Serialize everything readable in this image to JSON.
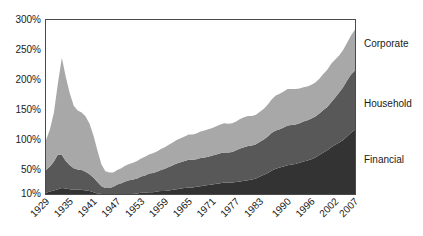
{
  "chart_data": {
    "type": "area",
    "stacked": true,
    "title": "",
    "subtitle": "",
    "xlabel": "",
    "ylabel": "",
    "grid": false,
    "legend_position": "right-inline",
    "x_tick_labels": [
      "1929",
      "1935",
      "1941",
      "1947",
      "1953",
      "1959",
      "1965",
      "1971",
      "1977",
      "1983",
      "1990",
      "1996",
      "2002",
      "2007"
    ],
    "y_tick_labels": [
      "300%",
      "250%",
      "200%",
      "150%",
      "100%",
      "50%",
      "10%"
    ],
    "y_tick_values": [
      300,
      250,
      200,
      150,
      100,
      50,
      10
    ],
    "ylim": [
      10,
      300
    ],
    "xlim": [
      1929,
      2007
    ],
    "x": [
      1929,
      1930,
      1931,
      1932,
      1933,
      1934,
      1935,
      1936,
      1937,
      1938,
      1939,
      1940,
      1941,
      1942,
      1943,
      1944,
      1945,
      1946,
      1947,
      1948,
      1949,
      1950,
      1951,
      1952,
      1953,
      1954,
      1955,
      1956,
      1957,
      1958,
      1959,
      1960,
      1961,
      1962,
      1963,
      1964,
      1965,
      1966,
      1967,
      1968,
      1969,
      1970,
      1971,
      1972,
      1973,
      1974,
      1975,
      1976,
      1977,
      1978,
      1979,
      1980,
      1981,
      1982,
      1983,
      1984,
      1985,
      1986,
      1987,
      1988,
      1989,
      1990,
      1991,
      1992,
      1993,
      1994,
      1995,
      1996,
      1997,
      1998,
      1999,
      2000,
      2001,
      2002,
      2003,
      2004,
      2005,
      2006,
      2007
    ],
    "series": [
      {
        "name": "Financial",
        "color": "#333333",
        "values": [
          12,
          14,
          16,
          18,
          20,
          19,
          18,
          17,
          17,
          17,
          16,
          15,
          13,
          11,
          9,
          8,
          8,
          8,
          9,
          9,
          10,
          10,
          10,
          11,
          12,
          12,
          13,
          13,
          14,
          15,
          15,
          16,
          17,
          18,
          19,
          20,
          21,
          21,
          22,
          23,
          24,
          25,
          26,
          27,
          28,
          29,
          29,
          29,
          30,
          31,
          32,
          33,
          34,
          36,
          39,
          42,
          45,
          49,
          52,
          54,
          56,
          58,
          59,
          60,
          62,
          64,
          66,
          68,
          71,
          75,
          79,
          83,
          88,
          92,
          96,
          100,
          106,
          112,
          117
        ]
      },
      {
        "name": "Household",
        "color": "#585858",
        "values": [
          38,
          42,
          48,
          58,
          55,
          46,
          40,
          36,
          34,
          33,
          31,
          28,
          24,
          19,
          14,
          12,
          12,
          14,
          17,
          19,
          21,
          23,
          24,
          25,
          27,
          29,
          31,
          32,
          33,
          35,
          37,
          39,
          41,
          43,
          44,
          45,
          46,
          46,
          46,
          47,
          47,
          47,
          48,
          49,
          50,
          50,
          50,
          51,
          53,
          55,
          56,
          57,
          57,
          57,
          58,
          59,
          61,
          63,
          64,
          64,
          65,
          66,
          66,
          66,
          66,
          67,
          67,
          68,
          68,
          69,
          71,
          72,
          75,
          79,
          83,
          88,
          93,
          97,
          99
        ]
      },
      {
        "name": "Corporate",
        "color": "#a8a8a8",
        "values": [
          50,
          62,
          82,
          118,
          162,
          140,
          120,
          104,
          98,
          96,
          92,
          84,
          70,
          52,
          36,
          28,
          26,
          24,
          24,
          25,
          26,
          27,
          28,
          29,
          30,
          31,
          32,
          33,
          34,
          35,
          36,
          37,
          38,
          39,
          40,
          41,
          42,
          42,
          43,
          44,
          45,
          46,
          46,
          47,
          48,
          49,
          48,
          48,
          48,
          49,
          50,
          50,
          49,
          49,
          50,
          51,
          53,
          56,
          58,
          59,
          60,
          61,
          60,
          59,
          58,
          57,
          56,
          56,
          57,
          58,
          60,
          62,
          64,
          63,
          62,
          62,
          63,
          65,
          68
        ]
      }
    ],
    "annotations": {
      "peak_year": 1933,
      "peak_total": 236
    }
  },
  "legend": {
    "entries": [
      {
        "label": "Corporate",
        "color": "#a8a8a8"
      },
      {
        "label": "Household",
        "color": "#585858"
      },
      {
        "label": "Financial",
        "color": "#333333"
      }
    ]
  }
}
